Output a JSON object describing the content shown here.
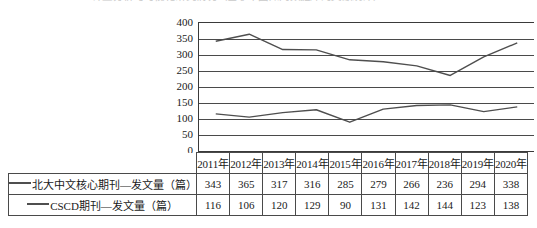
{
  "page": {
    "clipped_top_text": "计量分析与可视化研究情况（基于中国知网数据库的文献统计）"
  },
  "chart_data": {
    "type": "line",
    "title": "",
    "xlabel": "",
    "ylabel": "",
    "ylim": [
      0,
      400
    ],
    "ytick_step": 50,
    "yticks": [
      "400",
      "350",
      "300",
      "250",
      "200",
      "150",
      "100",
      "50",
      "0"
    ],
    "grid": true,
    "legend_position": "table-left",
    "categories": [
      "2011年",
      "2012年",
      "2013年",
      "2014年",
      "2015年",
      "2016年",
      "2017年",
      "2018年",
      "2019年",
      "2020年"
    ],
    "series": [
      {
        "name": "北大中文核心期刊—发文量（篇）",
        "color": "#4f4f4f",
        "values": [
          343,
          365,
          317,
          316,
          285,
          279,
          266,
          236,
          294,
          338
        ]
      },
      {
        "name": "CSCD期刊—发文量（篇）",
        "color": "#4f4f4f",
        "values": [
          116,
          106,
          120,
          129,
          90,
          131,
          142,
          144,
          123,
          138
        ]
      }
    ]
  }
}
